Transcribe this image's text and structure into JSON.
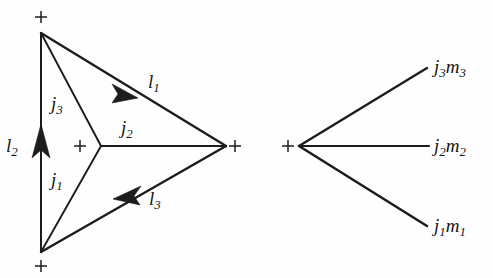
{
  "figure": {
    "background_color": "#fefefe",
    "ink_color": "#1c1c1c",
    "caption": "",
    "left_diagram": {
      "name": "triangle-recoupling-diagram",
      "vertex_markers": [
        "+",
        "+",
        "+",
        "+"
      ],
      "edge_labels": {
        "j1": "j",
        "j1_sub": "1",
        "j2": "j",
        "j2_sub": "2",
        "j3": "j",
        "j3_sub": "3",
        "l1": "l",
        "l1_sub": "1",
        "l2": "l",
        "l2_sub": "2",
        "l3": "l",
        "l3_sub": "3"
      }
    },
    "right_diagram": {
      "name": "three-leg-vertex-diagram",
      "vertex_markers": [
        "+"
      ],
      "leg_labels": [
        {
          "base": "j",
          "sub": "3",
          "base2": "m",
          "sub2": "3"
        },
        {
          "base": "j",
          "sub": "2",
          "base2": "m",
          "sub2": "2"
        },
        {
          "base": "j",
          "sub": "1",
          "base2": "m",
          "sub2": "1"
        }
      ]
    }
  }
}
